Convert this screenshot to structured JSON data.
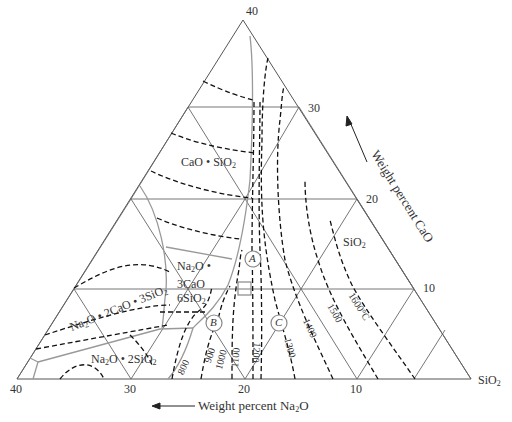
{
  "diagram": {
    "type": "ternary-phase-diagram",
    "components": {
      "apex_top": "CaO (axis 40%)",
      "bottom_right": "SiO2",
      "bottom_left": "Na2O (axis 40%)"
    },
    "axes": {
      "cao_axis_label": "Weight percent CaO",
      "na2o_axis_label": "Weight percent Na",
      "na2o_axis_label_sub": "2",
      "na2o_axis_label_end": "O",
      "cao_ticks": [
        "40",
        "30",
        "20",
        "10"
      ],
      "na2o_ticks": [
        "40",
        "30",
        "20",
        "10"
      ],
      "sio2_corner": "SiO",
      "sio2_corner_sub": "2"
    },
    "phase_fields": {
      "cao_sio2": {
        "a": "CaO • SiO",
        "sub": "2"
      },
      "sio2": {
        "a": "SiO",
        "sub": "2"
      },
      "na2o_3cao_6sio2": {
        "l1a": "Na",
        "l1sub": "2",
        "l1b": "O •",
        "l2": "3CaO",
        "l3a": "6SiO",
        "l3sub": "2"
      },
      "na2o_2cao_3sio2": {
        "a": "Na",
        "sub1": "2",
        "b": "O • 2CaO • 3SiO",
        "sub2": "2"
      },
      "na2o_2sio2": {
        "a": "Na",
        "sub1": "2",
        "b": "O • 2SiO",
        "sub2": "2"
      }
    },
    "isotherms": [
      "800",
      "900",
      "1000",
      "1100",
      "1200",
      "1300",
      "1400",
      "1500",
      "1600°C"
    ],
    "points": [
      "A",
      "B",
      "C"
    ],
    "colors": {
      "axis_line": "#555555",
      "boundary_line": "#999999",
      "isotherm": "#111111",
      "text": "#333333"
    }
  }
}
